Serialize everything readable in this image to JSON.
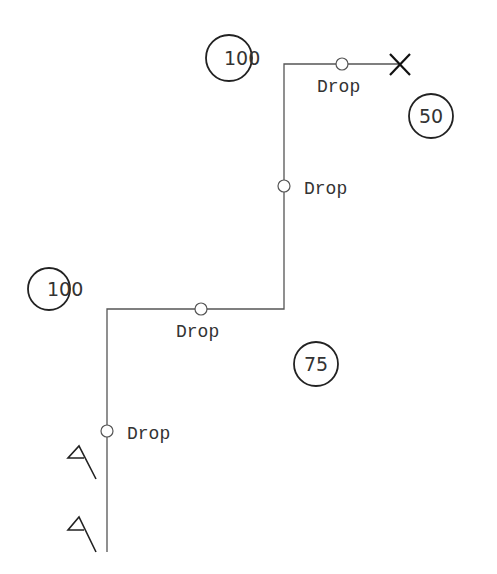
{
  "diagram": {
    "route": {
      "points": [
        [
          107,
          552
        ],
        [
          107,
          309
        ],
        [
          284,
          309
        ],
        [
          284,
          64
        ],
        [
          400,
          64
        ]
      ],
      "color": "#555555"
    },
    "drops": [
      {
        "label": "Drop",
        "x": 107,
        "y": 431,
        "label_x": 127,
        "label_y": 439
      },
      {
        "label": "Drop",
        "x": 201,
        "y": 309,
        "label_x": 176,
        "label_y": 337
      },
      {
        "label": "Drop",
        "x": 284,
        "y": 186,
        "label_x": 304,
        "label_y": 194
      },
      {
        "label": "Drop",
        "x": 342,
        "y": 64,
        "label_x": 317,
        "label_y": 92
      }
    ],
    "zones": [
      {
        "value": "100",
        "cx": 229,
        "cy": 58,
        "r": 23
      },
      {
        "value": "50",
        "cx": 431,
        "cy": 116,
        "r": 22
      },
      {
        "value": "100",
        "cx": 49,
        "cy": 289,
        "r": 21
      },
      {
        "value": "75",
        "cx": 316,
        "cy": 364,
        "r": 22
      }
    ],
    "end_marker": {
      "type": "x-mark",
      "cx": 400,
      "cy": 64
    },
    "flags": [
      {
        "type": "flag",
        "x": 79,
        "y": 446
      },
      {
        "type": "flag",
        "x": 79,
        "y": 517
      }
    ]
  }
}
